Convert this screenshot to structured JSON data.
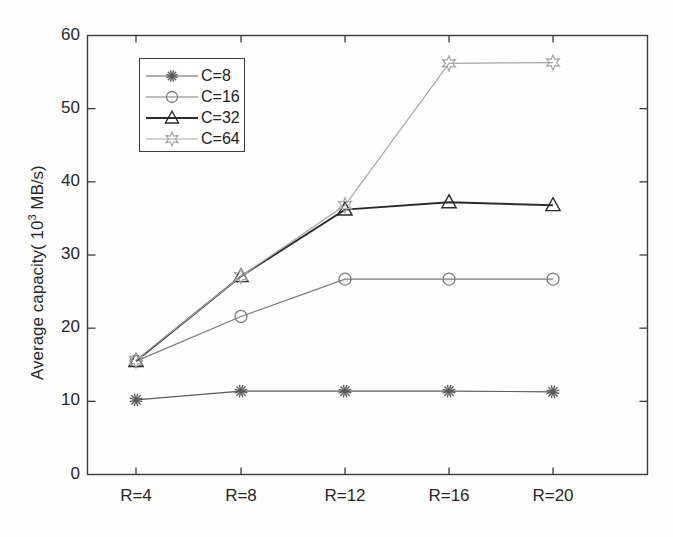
{
  "chart_data": {
    "type": "line",
    "title": "",
    "subtitle": "",
    "xlabel": "",
    "ylabel": "Average capacity( 10^3 MB/s)",
    "ylabel_parts": {
      "pre": "Average capacity( 10",
      "sup": "3",
      "post": " MB/s)"
    },
    "categories": [
      "R=4",
      "R=8",
      "R=12",
      "R=16",
      "R=20"
    ],
    "x_tick_labels": [
      "R=4",
      "R=8",
      "R=12",
      "R=16",
      "R=20"
    ],
    "y_tick_labels": [
      "0",
      "10",
      "20",
      "30",
      "40",
      "50",
      "60"
    ],
    "y_ticks": [
      0,
      10,
      20,
      30,
      40,
      50,
      60
    ],
    "ylim": [
      0,
      60
    ],
    "xlim": [
      0,
      6
    ],
    "grid": false,
    "legend_position": "upper-left-inside",
    "series": [
      {
        "name": "C=8",
        "label": "C=8",
        "marker": "asterisk",
        "color": "#5a5a5a",
        "values": [
          10.2,
          11.4,
          11.4,
          11.4,
          11.3
        ]
      },
      {
        "name": "C=16",
        "label": "C=16",
        "marker": "circle",
        "color": "#7b7b7b",
        "values": [
          15.5,
          21.6,
          26.7,
          26.7,
          26.7
        ]
      },
      {
        "name": "C=32",
        "label": "C=32",
        "marker": "triangle",
        "color": "#2b2b2b",
        "values": [
          15.5,
          27.1,
          36.2,
          37.2,
          36.8
        ]
      },
      {
        "name": "C=64",
        "label": "C=64",
        "marker": "star",
        "color": "#a6a6a6",
        "values": [
          15.6,
          27.1,
          36.8,
          56.2,
          56.3
        ]
      }
    ],
    "axis_color": "#3b3b3b",
    "background_color": "#fefefe"
  }
}
